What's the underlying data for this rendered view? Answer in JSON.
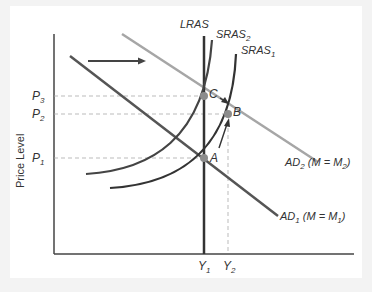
{
  "diagram": {
    "y_axis_label": "Price Level",
    "price_levels": [
      {
        "label": "P",
        "sub": "3",
        "y": 96
      },
      {
        "label": "P",
        "sub": "2",
        "y": 114
      },
      {
        "label": "P",
        "sub": "1",
        "y": 158
      }
    ],
    "output_levels": [
      {
        "label": "Y",
        "sub": "1",
        "x": 204
      },
      {
        "label": "Y",
        "sub": "2",
        "x": 228
      }
    ],
    "curves": {
      "lras": {
        "label": "LRAS"
      },
      "sras2": {
        "label": "SRAS",
        "sub": "2"
      },
      "sras1": {
        "label": "SRAS",
        "sub": "1"
      },
      "ad2": {
        "label": "AD",
        "sub": "2",
        "suffix": " (M = M",
        "suffix_sub": "2",
        "close": ")"
      },
      "ad1": {
        "label": "AD",
        "sub": "1",
        "suffix": " (M = M",
        "suffix_sub": "1",
        "close": ")"
      }
    },
    "points": [
      {
        "label": "A",
        "x": 204,
        "y": 158
      },
      {
        "label": "B",
        "x": 228,
        "y": 114
      },
      {
        "label": "C",
        "x": 204,
        "y": 96
      }
    ],
    "colors": {
      "ad2": "#a6a6a6",
      "ad1": "#555555",
      "sras": "#333333",
      "lras": "#333333",
      "axis": "#444444",
      "guide": "#aaaaaa",
      "point": "#8c8c8c"
    }
  }
}
